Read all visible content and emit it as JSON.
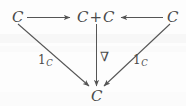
{
  "diagram": {
    "kind": "commutative-diagram",
    "stroke_color": "#555555",
    "text_color": "#4a4a4a",
    "background_color": "#fdfdfd",
    "nodes": [
      {
        "id": "top-left",
        "label": "C",
        "x": 13,
        "y": 11
      },
      {
        "id": "top-center",
        "label_left": "C",
        "label_op": "+",
        "label_right": "C",
        "x": 78,
        "y": 11
      },
      {
        "id": "top-right",
        "label": "C",
        "x": 168,
        "y": 11
      },
      {
        "id": "bottom",
        "label": "C",
        "x": 90,
        "y": 90
      }
    ],
    "edges": [
      {
        "id": "left-inclusion",
        "from": "top-left",
        "to": "top-center",
        "label": "",
        "direction": "right"
      },
      {
        "id": "right-inclusion",
        "from": "top-right",
        "to": "top-center",
        "label": "",
        "direction": "left"
      },
      {
        "id": "fold-map",
        "from": "top-center",
        "to": "bottom",
        "label": "∇",
        "direction": "down"
      },
      {
        "id": "left-identity",
        "from": "top-left",
        "to": "bottom",
        "label": "1",
        "sublabel": "C",
        "direction": "down-right"
      },
      {
        "id": "right-identity",
        "from": "top-right",
        "to": "bottom",
        "label": "1",
        "sublabel": "C",
        "direction": "down-left"
      }
    ],
    "labels": {
      "nabla": "∇",
      "identity_numeral": "1",
      "identity_subscript": "C",
      "object": "C",
      "coproduct_operator": "+"
    }
  }
}
